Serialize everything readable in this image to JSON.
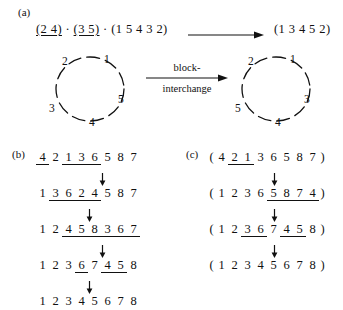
{
  "panels": {
    "a": "(a)",
    "b": "(b)",
    "c": "(c)"
  },
  "panel_a": {
    "left_expression": "(2 4) · (3 5) · (1 5 4 3 2)",
    "left_parts": [
      {
        "text": "(2 4)",
        "underline": true
      },
      {
        "text": " · ",
        "underline": false
      },
      {
        "text": "(3 5)",
        "underline": true
      },
      {
        "text": " · (1 5 4 3 2)",
        "underline": false
      }
    ],
    "right_expression": "(1 3 4 5 2)",
    "arrow_icon": "right-arrow-icon",
    "transform_label_line1": "block-",
    "transform_label_line2": "interchange",
    "left_circle": {
      "name": "cycle-diagram-left",
      "nodes": [
        {
          "label": "1",
          "x": 62,
          "y": 6
        },
        {
          "label": "2",
          "x": 20,
          "y": 8
        },
        {
          "label": "3",
          "x": 7,
          "y": 55
        },
        {
          "label": "4",
          "x": 47,
          "y": 69
        },
        {
          "label": "5",
          "x": 76,
          "y": 46
        }
      ]
    },
    "right_circle": {
      "name": "cycle-diagram-right",
      "nodes": [
        {
          "label": "1",
          "x": 62,
          "y": 6
        },
        {
          "label": "2",
          "x": 20,
          "y": 8
        },
        {
          "label": "5",
          "x": 7,
          "y": 55
        },
        {
          "label": "4",
          "x": 47,
          "y": 69
        },
        {
          "label": "3",
          "x": 76,
          "y": 46
        }
      ]
    }
  },
  "panel_b": {
    "rows": [
      {
        "tokens": [
          "4",
          "2",
          "1",
          "3",
          "6",
          "5",
          "8",
          "7"
        ],
        "underlined": [
          0,
          2,
          3,
          4
        ],
        "groups": [
          [
            0,
            0
          ],
          [
            2,
            4
          ]
        ]
      },
      {
        "tokens": [
          "1",
          "3",
          "6",
          "2",
          "4",
          "5",
          "8",
          "7"
        ],
        "underlined": [
          1,
          2,
          3,
          4
        ],
        "groups": [
          [
            1,
            2
          ],
          [
            3,
            4
          ]
        ]
      },
      {
        "tokens": [
          "1",
          "2",
          "4",
          "5",
          "8",
          "3",
          "6",
          "7"
        ],
        "underlined": [
          2,
          3,
          4,
          5,
          6,
          7
        ],
        "groups": [
          [
            2,
            4
          ],
          [
            5,
            7
          ]
        ]
      },
      {
        "tokens": [
          "1",
          "2",
          "3",
          "6",
          "7",
          "4",
          "5",
          "8"
        ],
        "underlined": [
          3,
          5,
          6
        ],
        "groups": [
          [
            3,
            3
          ],
          [
            5,
            6
          ]
        ]
      },
      {
        "tokens": [
          "1",
          "2",
          "3",
          "4",
          "5",
          "6",
          "7",
          "8"
        ],
        "underlined": [],
        "groups": []
      }
    ],
    "arrow_icon": "down-arrow-icon",
    "arrow_positions": [
      62,
      49,
      62,
      49
    ]
  },
  "panel_c": {
    "rows": [
      {
        "open": "(",
        "close": ")",
        "tokens": [
          "4",
          "2",
          "1",
          "3",
          "6",
          "5",
          "8",
          "7"
        ],
        "groups": [
          [
            1,
            1
          ],
          [
            2,
            2
          ]
        ]
      },
      {
        "open": "(",
        "close": ")",
        "tokens": [
          "1",
          "2",
          "3",
          "6",
          "5",
          "8",
          "7",
          "4"
        ],
        "groups": [
          [
            4,
            5
          ],
          [
            6,
            7
          ]
        ]
      },
      {
        "open": "(",
        "close": ")",
        "tokens": [
          "1",
          "2",
          "3",
          "6",
          "7",
          "4",
          "5",
          "8"
        ],
        "groups": [
          [
            2,
            3
          ],
          [
            5,
            6
          ]
        ]
      },
      {
        "open": "(",
        "close": ")",
        "tokens": [
          "1",
          "2",
          "3",
          "4",
          "5",
          "6",
          "7",
          "8"
        ],
        "groups": []
      }
    ],
    "arrow_icon": "down-arrow-icon",
    "arrow_positions": [
      62,
      62,
      62
    ]
  },
  "colors": {
    "ink": "#111111",
    "background": "#ffffff"
  }
}
